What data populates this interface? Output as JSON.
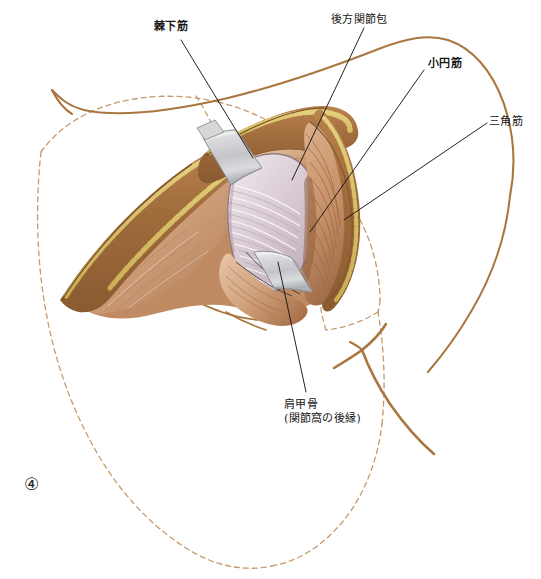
{
  "figure": {
    "number_glyph": "④",
    "caption_labels": {
      "infraspinatus": "棘下筋",
      "posterior_capsule": "後方関節包",
      "teres_minor": "小円筋",
      "deltoid": "三角筋",
      "scapula_line1": "肩甲骨",
      "scapula_line2": "(関節窩の後縁)"
    }
  },
  "colors": {
    "dashed_outline": "#c49a6c",
    "skin_edge": "#a9763f",
    "leader_line": "#161616",
    "muscle_mid": "#c08b63",
    "muscle_light": "#e0b392",
    "muscle_deep": "#a86b45",
    "fat_yellow": "#d9c36a",
    "capsule_pale": "#ddd0d6",
    "capsule_shadow": "#c3b2bd",
    "retractor_metal": "#cfd0d2",
    "retractor_edge": "#8d9095",
    "bone_outline": "#a9763f",
    "background": "#ffffff",
    "text": "#161616"
  },
  "elements": {
    "retractor_upper_name": "surgical-retractor-upper",
    "retractor_lower_name": "surgical-retractor-lower",
    "capsule_region_name": "posterior-joint-capsule-region",
    "infraspinatus_region_name": "infraspinatus-muscle-region",
    "deltoid_region_name": "deltoid-muscle-region",
    "teres_minor_region_name": "teres-minor-muscle-region",
    "scapula_outline_name": "scapula-dashed-outline",
    "humerus_outline_name": "humerus-outline"
  }
}
